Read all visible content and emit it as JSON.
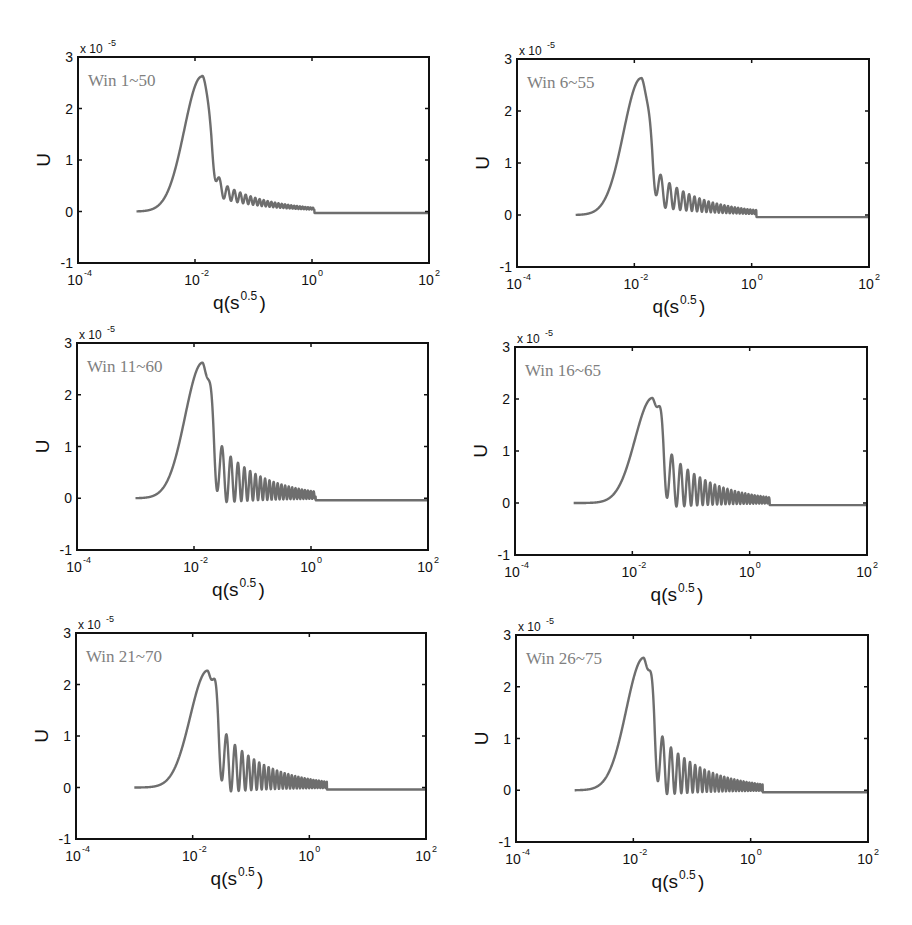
{
  "figure": {
    "background": "#ffffff",
    "curve_color": "#6e6e6e",
    "label_color": "#808080",
    "axis_color": "#111111"
  },
  "chart_data": [
    {
      "type": "line",
      "title": "Win 1~50",
      "xlabel": "q(s^0.5)",
      "ylabel": "U",
      "y_multiplier": "x 10^-5",
      "xscale": "log",
      "xlim": [
        0.0001,
        100
      ],
      "ylim": [
        -1,
        3
      ],
      "xticks": [
        "10^-4",
        "10^-2",
        "10^0",
        "10^2"
      ],
      "yticks": [
        "-1",
        "0",
        "1",
        "2",
        "3"
      ],
      "grid": false,
      "series": [
        {
          "name": "U",
          "start_q": 0.001,
          "peak_q": 0.013,
          "peak_U": 2.62,
          "second_peak_q": 0.027,
          "second_peak_U": 0.88,
          "oscillation_end_q": 1.1,
          "tail_U": -0.03,
          "oscillation_amplitude": "small"
        }
      ]
    },
    {
      "type": "line",
      "title": "Win 6~55",
      "xlabel": "q(s^0.5)",
      "ylabel": "U",
      "y_multiplier": "x 10^-5",
      "xscale": "log",
      "xlim": [
        0.0001,
        100
      ],
      "ylim": [
        -1,
        3
      ],
      "xticks": [
        "10^-4",
        "10^-2",
        "10^0",
        "10^2"
      ],
      "yticks": [
        "-1",
        "0",
        "1",
        "2",
        "3"
      ],
      "grid": false,
      "series": [
        {
          "name": "U",
          "start_q": 0.001,
          "peak_q": 0.013,
          "peak_U": 2.63,
          "second_peak_q": 0.03,
          "second_peak_U": 0.95,
          "oscillation_end_q": 1.2,
          "tail_U": -0.04,
          "oscillation_amplitude": "moderate"
        }
      ]
    },
    {
      "type": "line",
      "title": "Win 11~60",
      "xlabel": "q(s^0.5)",
      "ylabel": "U",
      "y_multiplier": "x 10^-5",
      "xscale": "log",
      "xlim": [
        0.0001,
        100
      ],
      "ylim": [
        -1,
        3
      ],
      "xticks": [
        "10^-4",
        "10^-2",
        "10^0",
        "10^2"
      ],
      "yticks": [
        "-1",
        "0",
        "1",
        "2",
        "3"
      ],
      "grid": false,
      "series": [
        {
          "name": "U",
          "start_q": 0.001,
          "peak_q": 0.014,
          "peak_U": 2.62,
          "second_peak_q": 0.032,
          "second_peak_U": 1.02,
          "oscillation_end_q": 1.2,
          "tail_U": -0.04,
          "oscillation_amplitude": "large"
        }
      ]
    },
    {
      "type": "line",
      "title": "Win 16~65",
      "xlabel": "q(s^0.5)",
      "ylabel": "U",
      "y_multiplier": "x 10^-5",
      "xscale": "log",
      "xlim": [
        0.0001,
        100
      ],
      "ylim": [
        -1,
        3
      ],
      "xticks": [
        "10^-4",
        "10^-2",
        "10^0",
        "10^2"
      ],
      "yticks": [
        "-1",
        "0",
        "1",
        "2",
        "3"
      ],
      "grid": false,
      "series": [
        {
          "name": "U",
          "start_q": 0.001,
          "peak_q": 0.022,
          "peak_U": 2.02,
          "second_peak_q": 0.05,
          "second_peak_U": 0.95,
          "oscillation_end_q": 2.2,
          "tail_U": -0.04,
          "oscillation_amplitude": "large"
        }
      ]
    },
    {
      "type": "line",
      "title": "Win 21~70",
      "xlabel": "q(s^0.5)",
      "ylabel": "U",
      "y_multiplier": "x 10^-5",
      "xscale": "log",
      "xlim": [
        0.0001,
        100
      ],
      "ylim": [
        -1,
        3
      ],
      "xticks": [
        "10^-4",
        "10^-2",
        "10^0",
        "10^2"
      ],
      "yticks": [
        "-1",
        "0",
        "1",
        "2",
        "3"
      ],
      "grid": false,
      "series": [
        {
          "name": "U",
          "start_q": 0.001,
          "peak_q": 0.018,
          "peak_U": 2.27,
          "second_peak_q": 0.04,
          "second_peak_U": 1.05,
          "oscillation_end_q": 2.0,
          "tail_U": -0.04,
          "oscillation_amplitude": "large"
        }
      ]
    },
    {
      "type": "line",
      "title": "Win 26~75",
      "xlabel": "q(s^0.5)",
      "ylabel": "U",
      "y_multiplier": "x 10^-5",
      "xscale": "log",
      "xlim": [
        0.0001,
        100
      ],
      "ylim": [
        -1,
        3
      ],
      "xticks": [
        "10^-4",
        "10^-2",
        "10^0",
        "10^2"
      ],
      "yticks": [
        "-1",
        "0",
        "1",
        "2",
        "3"
      ],
      "grid": false,
      "series": [
        {
          "name": "U",
          "start_q": 0.001,
          "peak_q": 0.015,
          "peak_U": 2.56,
          "second_peak_q": 0.033,
          "second_peak_U": 1.05,
          "oscillation_end_q": 1.6,
          "tail_U": -0.04,
          "oscillation_amplitude": "large"
        }
      ]
    }
  ],
  "panels": [
    {
      "title": "Win 1~50",
      "box": [
        78,
        57,
        351,
        206
      ]
    },
    {
      "title": "Win 6~55",
      "box": [
        517,
        59,
        352,
        208
      ]
    },
    {
      "title": "Win 11~60",
      "box": [
        77,
        343,
        351,
        207
      ]
    },
    {
      "title": "Win 16~65",
      "box": [
        515,
        347,
        352,
        208
      ]
    },
    {
      "title": "Win 21~70",
      "box": [
        76,
        633,
        350,
        206
      ]
    },
    {
      "title": "Win 26~75",
      "box": [
        516,
        635,
        352,
        207
      ]
    }
  ],
  "axis_text": {
    "ylabel": "U",
    "xlabel_base": "q(s",
    "xlabel_sup": "0.5",
    "xlabel_close": ")",
    "scale_base": "x 10",
    "scale_exp": "-5",
    "yticks": [
      "3",
      "2",
      "1",
      "0",
      "-1"
    ],
    "xtick_base": "10",
    "xtick_exps": [
      "-4",
      "-2",
      "0",
      "2"
    ]
  }
}
